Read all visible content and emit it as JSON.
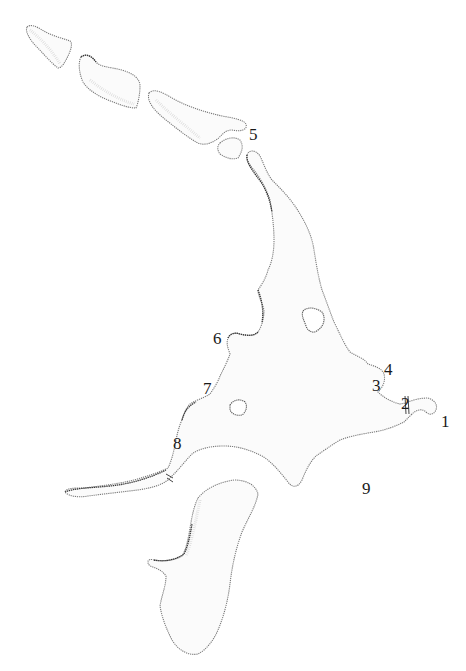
{
  "map": {
    "style": "stippled island outline map",
    "colors": {
      "background": "#ffffff",
      "land_fill": "#fbfbfb",
      "coastline": "#7a7a7a",
      "label": "#1a1a1a"
    },
    "labels": [
      {
        "id": "1",
        "text": "1",
        "x": 441,
        "y": 413
      },
      {
        "id": "2",
        "text": "2",
        "x": 401,
        "y": 395
      },
      {
        "id": "3",
        "text": "3",
        "x": 372,
        "y": 377
      },
      {
        "id": "4",
        "text": "4",
        "x": 384,
        "y": 361
      },
      {
        "id": "5",
        "text": "5",
        "x": 249,
        "y": 126
      },
      {
        "id": "6",
        "text": "6",
        "x": 213,
        "y": 330
      },
      {
        "id": "7",
        "text": "7",
        "x": 203,
        "y": 380
      },
      {
        "id": "8",
        "text": "8",
        "x": 173,
        "y": 435
      },
      {
        "id": "9",
        "text": "9",
        "x": 362,
        "y": 480
      }
    ],
    "features": [
      {
        "id": "islet-nw-1",
        "type": "island"
      },
      {
        "id": "islet-nw-2",
        "type": "island"
      },
      {
        "id": "islet-nw-3",
        "type": "island"
      },
      {
        "id": "islet-small-square",
        "type": "island"
      },
      {
        "id": "main-island",
        "type": "island"
      },
      {
        "id": "southern-island",
        "type": "island"
      },
      {
        "id": "lake-east",
        "type": "lake"
      },
      {
        "id": "lake-west",
        "type": "lake"
      }
    ]
  }
}
